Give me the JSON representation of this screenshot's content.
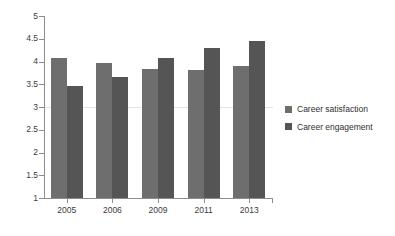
{
  "chart_data": {
    "type": "bar",
    "title": "",
    "xlabel": "",
    "ylabel": "",
    "categories": [
      "2005",
      "2006",
      "2009",
      "2011",
      "2013"
    ],
    "series": [
      {
        "name": "Career satisfaction",
        "color": "#6e6e6e",
        "values": [
          4.07,
          3.97,
          3.83,
          3.81,
          3.9
        ]
      },
      {
        "name": "Career engagement",
        "color": "#555555",
        "values": [
          3.47,
          3.65,
          4.08,
          4.29,
          4.45
        ]
      }
    ],
    "ylim": [
      1,
      5
    ],
    "ytick_step": 0.5,
    "ytick_labels": [
      "5",
      "4.5",
      "4",
      "3.5",
      "3",
      "2.5",
      "2",
      "1.5",
      "1"
    ],
    "ytick_values": [
      5,
      4.5,
      4,
      3.5,
      3,
      2.5,
      2,
      1.5,
      1
    ],
    "grid": "single faint horizontal line at y=3",
    "gridline_values": [
      3
    ],
    "legend_position": "right",
    "background_color": "#ffffff",
    "axis_color": "#8d8d8d"
  },
  "legend": {
    "items": [
      {
        "label": "Career satisfaction"
      },
      {
        "label": "Career engagement"
      }
    ]
  }
}
